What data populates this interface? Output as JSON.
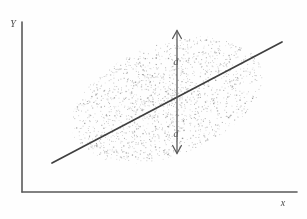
{
  "figure": {
    "kind": "scatter-with-regression-line",
    "style": "hand-drawn pencil sketch",
    "background_color": "#fefefe",
    "ink_color": "#4a4a4a",
    "point_color": "#8d8d8d"
  },
  "axes": {
    "y_axis": {
      "label": "Y",
      "name": "y-axis",
      "x": 22,
      "y_top": 22,
      "y_bottom": 192
    },
    "x_axis": {
      "label": "x",
      "name": "x-axis",
      "y": 192,
      "x_left": 22,
      "x_right": 297
    },
    "y_label_pos": {
      "x": 13,
      "y": 27
    },
    "x_label_pos": {
      "x": 283,
      "y": 206
    }
  },
  "annotations": {
    "upper_distance_label": "d",
    "lower_distance_label": "d",
    "upper_label_pos": {
      "x": 176,
      "y": 65
    },
    "lower_label_pos": {
      "x": 176,
      "y": 137
    }
  },
  "chart_data": {
    "type": "scatter",
    "title": "",
    "xlabel": "x",
    "ylabel": "Y",
    "grid": false,
    "legend": null,
    "xlim": [
      22,
      297
    ],
    "ylim": [
      192,
      22
    ],
    "point_count": 1700,
    "cloud": {
      "shape": "tilted-ellipse",
      "center_x": 167,
      "center_y": 100,
      "semi_major": 100,
      "semi_minor": 56,
      "rotation_deg": -21
    },
    "regression_line": {
      "name": "regression-line",
      "x1": 52,
      "y1": 163,
      "x2": 282,
      "y2": 42,
      "slope": -0.526,
      "description": "least-squares fit line through scatter cloud"
    },
    "residual_marker": {
      "name": "vertical-residual-arrow",
      "x": 177,
      "y_top": 31,
      "y_bottom": 153,
      "y_line_crossing": 97,
      "upper_label": "d",
      "lower_label": "d",
      "description": "double-headed vertical arrow showing equal distances d above and below the line"
    }
  }
}
